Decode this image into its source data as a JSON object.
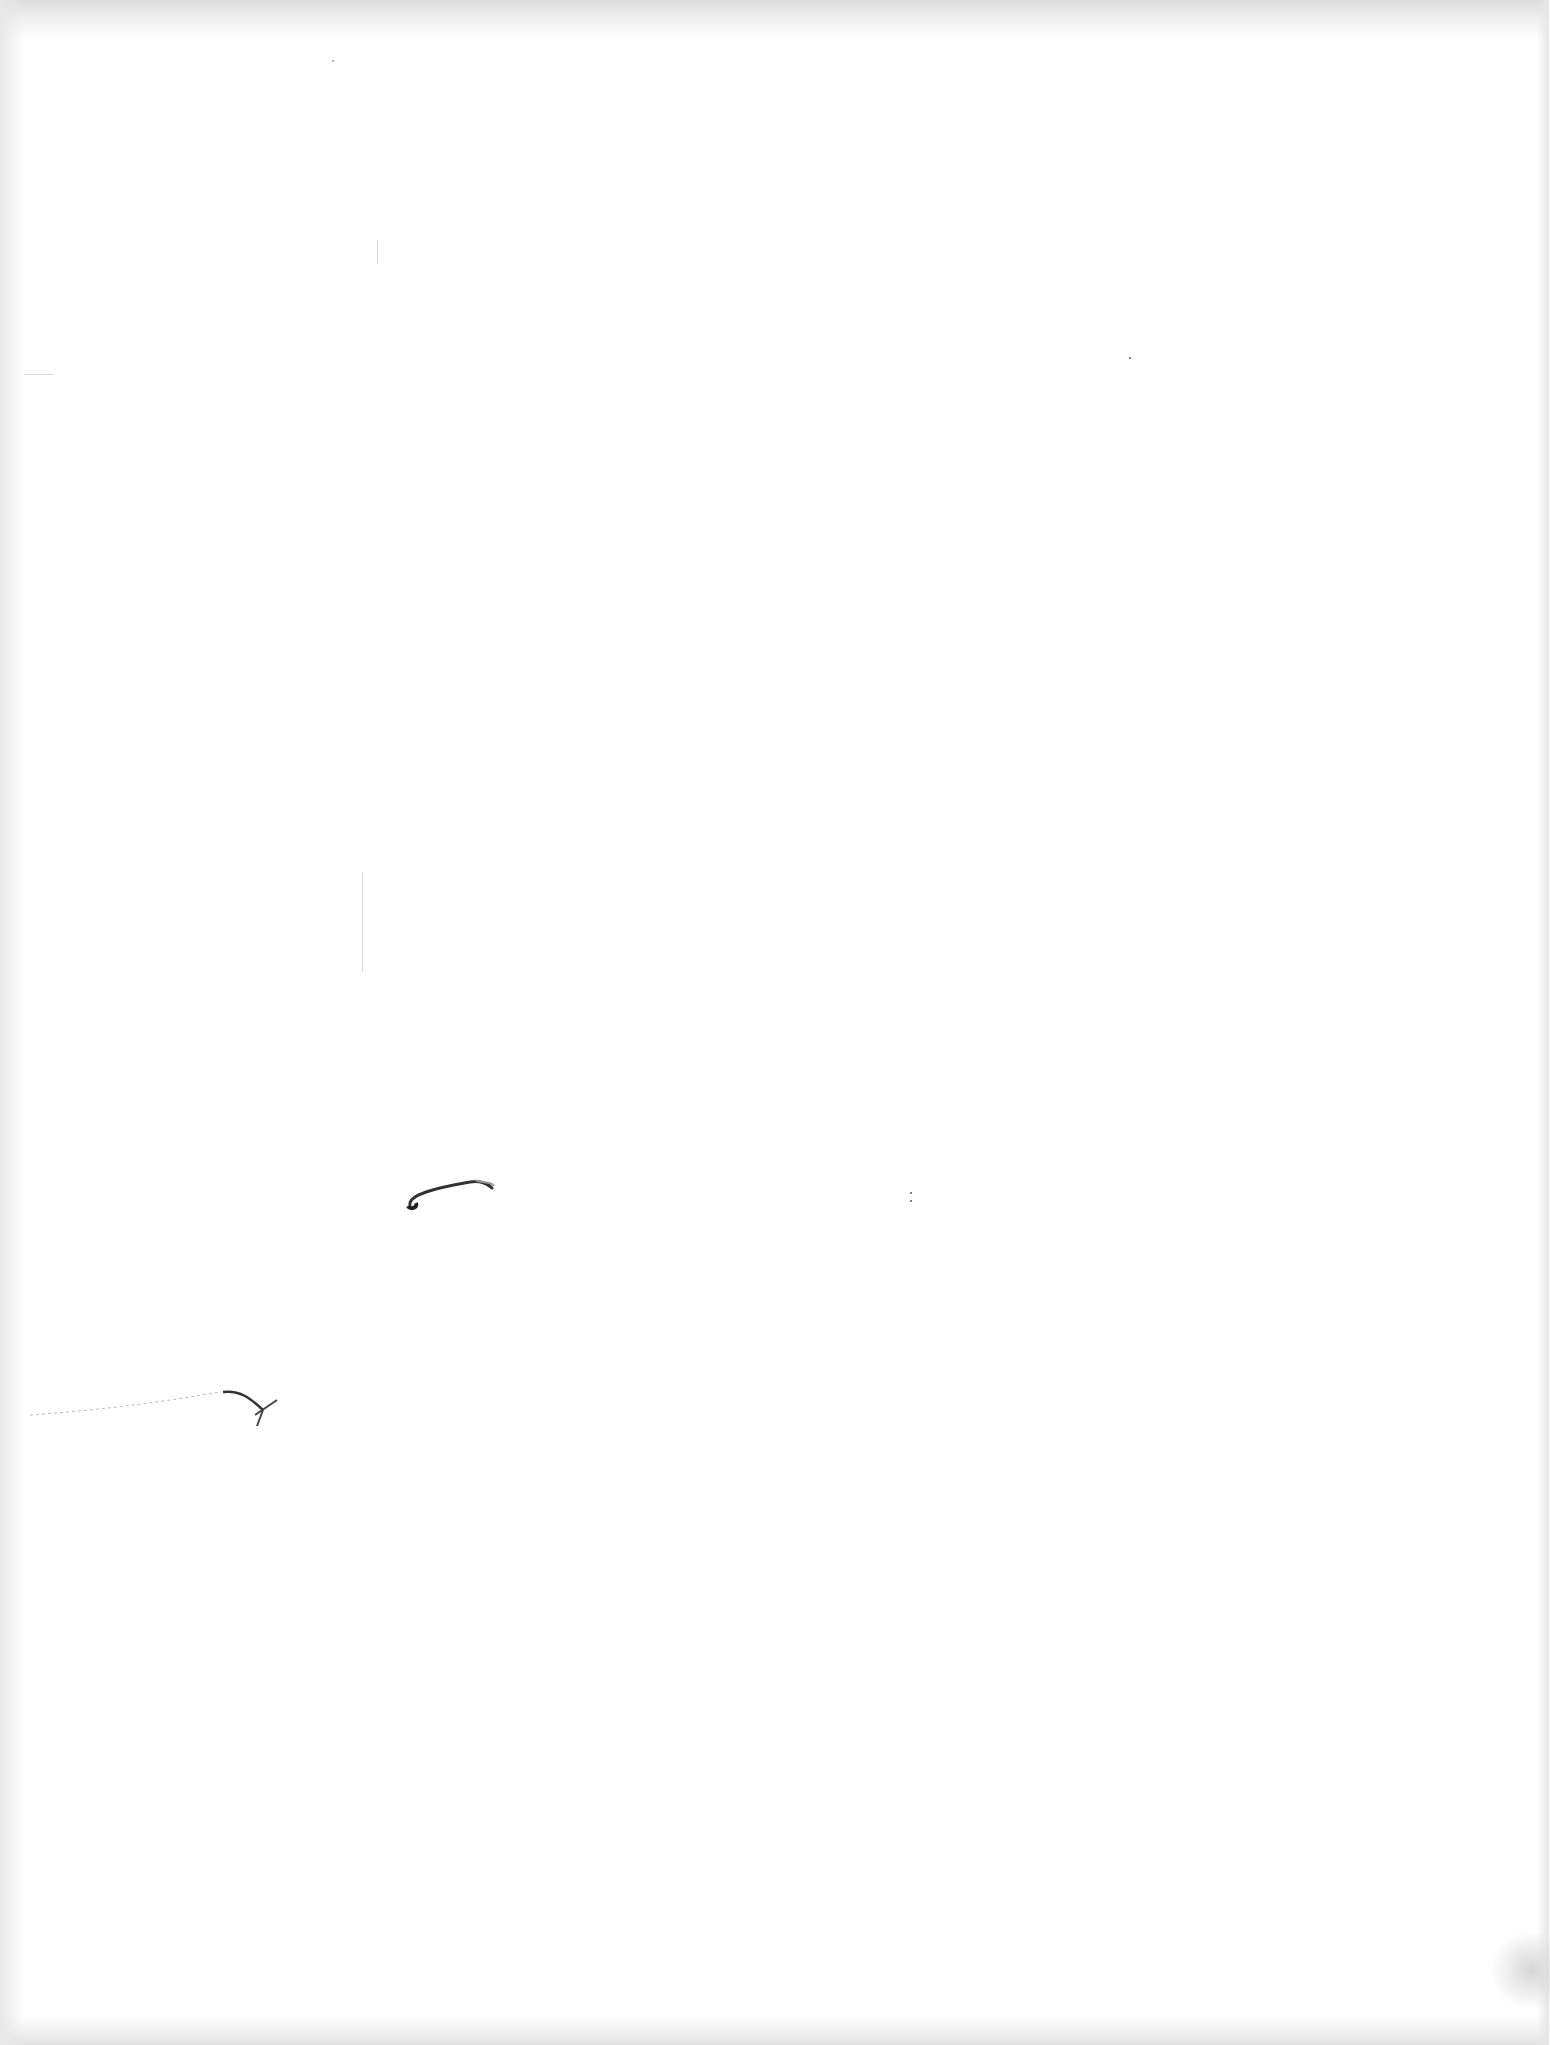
{
  "page": {
    "type": "blank scanned page",
    "background": "#ffffff",
    "bleed_through_top": "",
    "bleed_through_bottom": ""
  },
  "marks": [
    {
      "name": "pen-stroke-mark",
      "description": "curved ink stroke"
    },
    {
      "name": "pen-arrow-mark",
      "description": "faint line ending in a hooked stroke"
    }
  ]
}
